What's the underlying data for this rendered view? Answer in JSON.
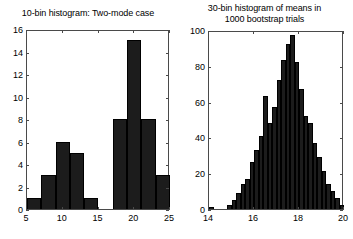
{
  "figure": {
    "background": "#ffffff",
    "ink": "#000000",
    "bar_color": "#1c1c1c",
    "axis_color": "#4a4a4a"
  },
  "chart_data": [
    {
      "id": "left",
      "type": "bar",
      "title": "10-bin histogram: Two-mode case",
      "xlabel": "",
      "ylabel": "",
      "xlim": [
        5,
        25
      ],
      "ylim": [
        0,
        16
      ],
      "grid": false,
      "legend": "none",
      "bin_width": 2,
      "bin_edges": [
        5,
        7,
        9,
        11,
        13,
        15,
        17,
        19,
        21,
        23,
        25
      ],
      "bin_centers": [
        6,
        8,
        10,
        12,
        14,
        16,
        18,
        20,
        22,
        24
      ],
      "values": [
        1,
        3,
        6,
        5,
        1,
        0,
        8,
        15,
        8,
        3
      ],
      "total_count": 50,
      "xticks": [
        5,
        10,
        15,
        20,
        25
      ],
      "xticklabels": [
        "5",
        "10",
        "15",
        "20",
        "25"
      ],
      "yticks": [
        0,
        2,
        4,
        6,
        8,
        10,
        12,
        14,
        16
      ],
      "yticklabels": [
        "0",
        "2",
        "4",
        "6",
        "8",
        "10",
        "12",
        "14",
        "16"
      ]
    },
    {
      "id": "right",
      "type": "bar",
      "title": "30-bin histogram of means in\n1000 bootstrap trials",
      "xlabel": "",
      "ylabel": "",
      "xlim": [
        14,
        20
      ],
      "ylim": [
        0,
        100
      ],
      "grid": false,
      "legend": "none",
      "bin_width": 0.2,
      "bin_edges": [
        14.0,
        14.2,
        14.4,
        14.6,
        14.8,
        15.0,
        15.2,
        15.4,
        15.6,
        15.8,
        16.0,
        16.2,
        16.4,
        16.6,
        16.8,
        17.0,
        17.2,
        17.4,
        17.6,
        17.8,
        18.0,
        18.2,
        18.4,
        18.6,
        18.8,
        19.0,
        19.2,
        19.4,
        19.6,
        19.8,
        20.0
      ],
      "bin_centers": [
        14.1,
        14.3,
        14.5,
        14.7,
        14.9,
        15.1,
        15.3,
        15.5,
        15.7,
        15.9,
        16.1,
        16.3,
        16.5,
        16.7,
        16.9,
        17.1,
        17.3,
        17.5,
        17.7,
        17.9,
        18.1,
        18.3,
        18.5,
        18.7,
        18.9,
        19.1,
        19.3,
        19.5,
        19.7,
        19.9
      ],
      "values": [
        1,
        0,
        0,
        0,
        2,
        5,
        9,
        14,
        17,
        26,
        33,
        41,
        63,
        48,
        57,
        72,
        83,
        92,
        97,
        82,
        67,
        52,
        48,
        37,
        29,
        21,
        14,
        10,
        6,
        2
      ],
      "total_count": 1000,
      "xticks": [
        14,
        16,
        18,
        20
      ],
      "xticklabels": [
        "14",
        "16",
        "18",
        "20"
      ],
      "yticks": [
        0,
        20,
        40,
        60,
        80,
        100
      ],
      "yticklabels": [
        "0",
        "20",
        "40",
        "60",
        "80",
        "100"
      ]
    }
  ]
}
